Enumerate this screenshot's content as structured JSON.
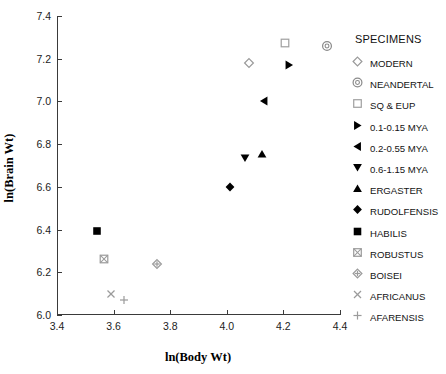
{
  "chart_data": {
    "type": "scatter",
    "title": "",
    "xlabel": "ln(Body Wt)",
    "ylabel": "ln(Brain Wt)",
    "xlim": [
      3.4,
      4.4
    ],
    "ylim": [
      6.0,
      7.4
    ],
    "xticks": [
      "3.4",
      "3.6",
      "3.8",
      "4.0",
      "4.2",
      "4.4"
    ],
    "yticks": [
      "6.0",
      "6.2",
      "6.4",
      "6.6",
      "6.8",
      "7.0",
      "7.2",
      "7.4"
    ],
    "grid": false,
    "legend_position": "right",
    "legend_title": "SPECIMENS",
    "series": [
      {
        "name": "MODERN",
        "marker": "open-diamond",
        "color": "#9a9a9a",
        "points": [
          {
            "x": 4.08,
            "y": 7.18
          }
        ]
      },
      {
        "name": "NEANDERTAL",
        "marker": "target-circle",
        "color": "#8a8a8a",
        "points": [
          {
            "x": 4.355,
            "y": 7.26
          }
        ]
      },
      {
        "name": "SQ & EUP",
        "marker": "open-square",
        "color": "#a0a0a0",
        "points": [
          {
            "x": 4.205,
            "y": 7.275
          }
        ]
      },
      {
        "name": "0.1-0.15 MYA",
        "marker": "right-triangle",
        "color": "#000000",
        "points": [
          {
            "x": 4.22,
            "y": 7.17
          }
        ]
      },
      {
        "name": "0.2-0.55 MYA",
        "marker": "left-triangle",
        "color": "#000000",
        "points": [
          {
            "x": 4.13,
            "y": 7.0
          }
        ]
      },
      {
        "name": "0.6-1.15 MYA",
        "marker": "down-triangle",
        "color": "#000000",
        "points": [
          {
            "x": 4.065,
            "y": 6.735
          }
        ]
      },
      {
        "name": "ERGASTER",
        "marker": "up-triangle",
        "color": "#000000",
        "points": [
          {
            "x": 4.125,
            "y": 6.755
          }
        ]
      },
      {
        "name": "RUDOLFENSIS",
        "marker": "filled-diamond",
        "color": "#000000",
        "points": [
          {
            "x": 4.01,
            "y": 6.6
          }
        ]
      },
      {
        "name": "HABILIS",
        "marker": "filled-square",
        "color": "#000000",
        "points": [
          {
            "x": 3.54,
            "y": 6.395
          }
        ]
      },
      {
        "name": "ROBUSTUS",
        "marker": "hatched-square",
        "color": "#9b9b9b",
        "points": [
          {
            "x": 3.565,
            "y": 6.26
          }
        ]
      },
      {
        "name": "BOISEI",
        "marker": "cross-diamond",
        "color": "#9b9b9b",
        "points": [
          {
            "x": 3.755,
            "y": 6.24
          }
        ]
      },
      {
        "name": "AFRICANUS",
        "marker": "x-mark",
        "color": "#9b9b9b",
        "points": [
          {
            "x": 3.59,
            "y": 6.1
          }
        ]
      },
      {
        "name": "AFARENSIS",
        "marker": "plus-mark",
        "color": "#9b9b9b",
        "points": [
          {
            "x": 3.635,
            "y": 6.07
          }
        ]
      }
    ]
  },
  "axes": {
    "x_title": "ln(Body Wt)",
    "y_title": "ln(Brain Wt)",
    "x_tick_labels": [
      "3.4",
      "3.6",
      "3.8",
      "4.0",
      "4.2",
      "4.4"
    ],
    "y_tick_labels": [
      "6.0",
      "6.2",
      "6.4",
      "6.6",
      "6.8",
      "7.0",
      "7.2",
      "7.4"
    ]
  },
  "legend": {
    "title": "SPECIMENS",
    "items": [
      {
        "label": "MODERN"
      },
      {
        "label": "NEANDERTAL"
      },
      {
        "label": "SQ & EUP"
      },
      {
        "label": "0.1-0.15 MYA"
      },
      {
        "label": "0.2-0.55 MYA"
      },
      {
        "label": "0.6-1.15 MYA"
      },
      {
        "label": "ERGASTER"
      },
      {
        "label": "RUDOLFENSIS"
      },
      {
        "label": "HABILIS"
      },
      {
        "label": "ROBUSTUS"
      },
      {
        "label": "BOISEI"
      },
      {
        "label": "AFRICANUS"
      },
      {
        "label": "AFARENSIS"
      }
    ]
  }
}
